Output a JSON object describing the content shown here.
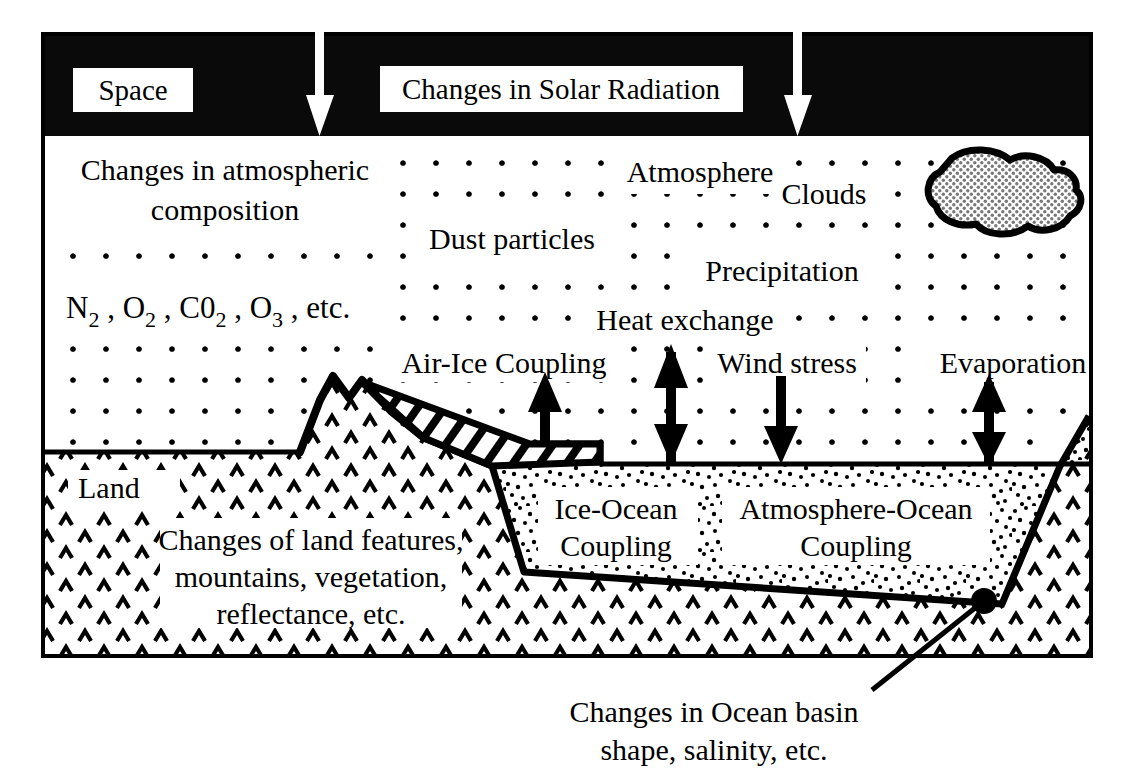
{
  "figure": {
    "space_band_label": "Space",
    "solar_label": "Changes in Solar Radiation"
  },
  "colors": {
    "space_band": "#0a0a0a",
    "ink": "#000000",
    "paper": "#ffffff",
    "cloud_fill": "#9a9a9a",
    "arrow_white": "#ffffff"
  },
  "atmosphere": {
    "composition_line1": "Changes in atmospheric",
    "composition_line2": "composition",
    "gases": "N2 , O2 , C02 , O3 , etc.",
    "gases_parts": [
      {
        "base": "N",
        "sub": "2"
      },
      {
        "base": ", O",
        "sub": "2"
      },
      {
        "base": ", C0",
        "sub": "2"
      },
      {
        "base": ", O",
        "sub": "3"
      },
      {
        "base": ", etc.",
        "sub": ""
      }
    ],
    "label_atmosphere": "Atmosphere",
    "label_clouds": "Clouds",
    "label_dust": "Dust particles",
    "label_precipitation": "Precipitation"
  },
  "fluxes": [
    {
      "name": "air-ice-coupling",
      "label": "Air-Ice Coupling",
      "direction": "up"
    },
    {
      "name": "heat-exchange",
      "label": "Heat exchange",
      "direction": "both"
    },
    {
      "name": "wind-stress",
      "label": "Wind stress",
      "direction": "down"
    },
    {
      "name": "evaporation",
      "label": "Evaporation",
      "direction": "both"
    }
  ],
  "surface": {
    "label_land": "Land",
    "land_changes_line1": "Changes of land features,",
    "land_changes_line2": "mountains, vegetation,",
    "land_changes_line3": "reflectance, etc.",
    "label_ice_ocean_line1": "Ice-Ocean",
    "label_ice_ocean_line2": "Coupling",
    "label_atmos_ocean_line1": "Atmosphere-Ocean",
    "label_atmos_ocean_line2": "Coupling"
  },
  "caption": {
    "line1": "Changes in Ocean basin",
    "line2": "shape, salinity, etc."
  }
}
